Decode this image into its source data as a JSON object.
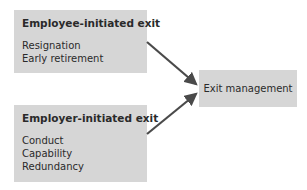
{
  "diagram": {
    "sources": [
      {
        "title": "Employee-initiated exit",
        "items": [
          "Resignation",
          "Early retirement"
        ]
      },
      {
        "title": "Employer-initiated exit",
        "items": [
          "Conduct",
          "Capability",
          "Redundancy"
        ]
      }
    ],
    "target": {
      "label": "Exit management"
    },
    "colors": {
      "box_fill": "#d6d6d6",
      "arrow": "#4a4a4a",
      "text": "#2a2a2a"
    }
  }
}
